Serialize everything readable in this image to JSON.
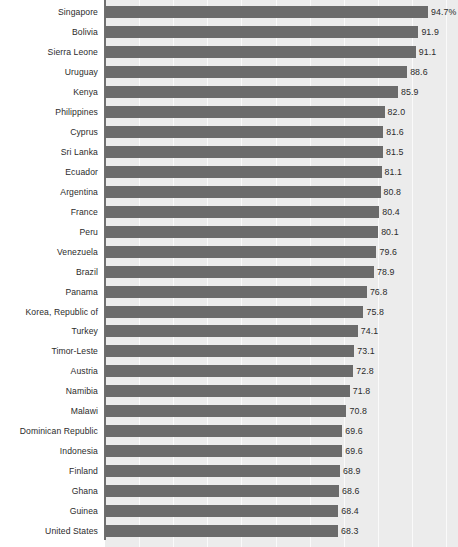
{
  "chart_data": {
    "type": "bar",
    "orientation": "horizontal",
    "title": "",
    "subtitle": "",
    "xlabel": "",
    "ylabel": "",
    "xlim": [
      0,
      103.5
    ],
    "grid": true,
    "grid_axis": "x",
    "legend": "none",
    "value_suffix_first": "%",
    "categories": [
      "Singapore",
      "Bolivia",
      "Sierra Leone",
      "Uruguay",
      "Kenya",
      "Philippines",
      "Cyprus",
      "Sri Lanka",
      "Ecuador",
      "Argentina",
      "France",
      "Peru",
      "Venezuela",
      "Brazil",
      "Panama",
      "Korea, Republic of",
      "Turkey",
      "Timor-Leste",
      "Austria",
      "Namibia",
      "Malawi",
      "Dominican Republic",
      "Indonesia",
      "Finland",
      "Ghana",
      "Guinea",
      "United States"
    ],
    "values": [
      94.7,
      91.9,
      91.1,
      88.6,
      85.9,
      82.0,
      81.6,
      81.5,
      81.1,
      80.8,
      80.4,
      80.1,
      79.6,
      78.9,
      76.8,
      75.8,
      74.1,
      73.1,
      72.8,
      71.8,
      70.8,
      69.6,
      69.6,
      68.9,
      68.6,
      68.4,
      68.3
    ],
    "data_labels": [
      "94.7%",
      "91.9",
      "91.1",
      "88.6",
      "85.9",
      "82.0",
      "81.6",
      "81.5",
      "81.1",
      "80.8",
      "80.4",
      "80.1",
      "79.6",
      "78.9",
      "76.8",
      "75.8",
      "74.1",
      "73.1",
      "72.8",
      "71.8",
      "70.8",
      "69.6",
      "69.6",
      "68.9",
      "68.6",
      "68.4",
      "68.3"
    ],
    "gridline_values": [
      10,
      20,
      30,
      40,
      50,
      60,
      70,
      80,
      90,
      100
    ],
    "colors": {
      "bar": "#6b6b6b",
      "plot_background": "#ececec",
      "page_background": "#ffffff",
      "gridline": "#fafafa",
      "axis": "#6f6f6f",
      "text": "#2b2b2b"
    }
  }
}
